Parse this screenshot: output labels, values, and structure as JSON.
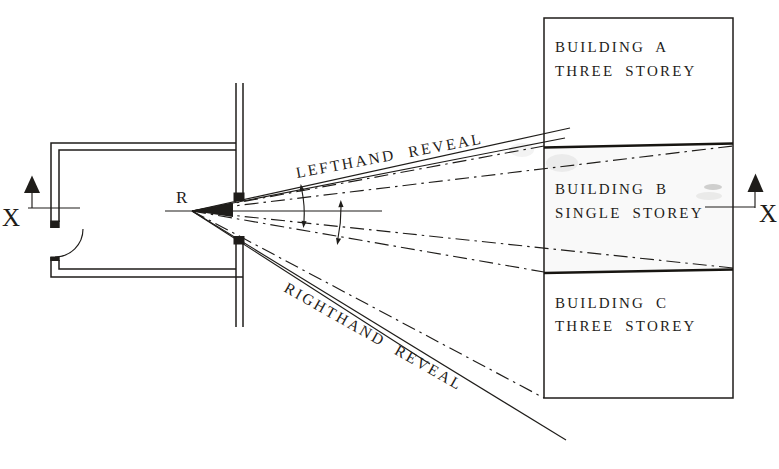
{
  "figure": {
    "type": "architectural plan diagram",
    "reference_point_label": "R",
    "section_marker_left_label": "X",
    "section_marker_right_label": "X",
    "lefthand_reveal_label": "LEFTHAND REVEAL",
    "righthand_reveal_label": "RIGHTHAND REVEAL",
    "buildings": [
      {
        "name": "BUILDING A",
        "storeys": "THREE STOREY"
      },
      {
        "name": "BUILDING B",
        "storeys": "SINGLE STOREY"
      },
      {
        "name": "BUILDING C",
        "storeys": "THREE STOREY"
      }
    ],
    "colors": {
      "ink": "#1f1d1a",
      "paper": "#ffffff"
    },
    "icons": [
      {
        "name": "section-arrow-left",
        "glyph": "filled triangle pointing up"
      },
      {
        "name": "section-arrow-right",
        "glyph": "filled triangle pointing up"
      }
    ]
  }
}
